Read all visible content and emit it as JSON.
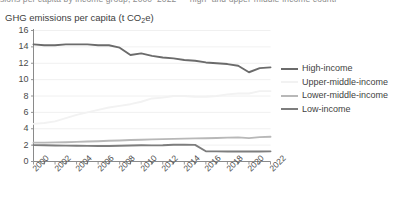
{
  "top_caption_fragment": "sions per capita by income group, 2000–2022 — high- and upper-middle-income countr",
  "chart_data": {
    "type": "line",
    "title": "GHG emissions per capita (t CO",
    "title_sub": "2",
    "title_suffix": "e)",
    "title_full": "GHG emissions per capita (t CO2e)",
    "xlabel": "",
    "ylabel": "",
    "ylim": [
      0,
      16
    ],
    "ytick_step": 2,
    "yticks": [
      "16",
      "14",
      "12",
      "10",
      "8",
      "6",
      "4",
      "2",
      "0"
    ],
    "ytick_values": [
      16,
      14,
      12,
      10,
      8,
      6,
      4,
      2,
      0
    ],
    "xlim": [
      2000,
      2022
    ],
    "xticks": [
      "2000",
      "2002",
      "2004",
      "2006",
      "2008",
      "2010",
      "2012",
      "2014",
      "2016",
      "2018",
      "2020",
      "2022"
    ],
    "xtick_values": [
      2000,
      2002,
      2004,
      2006,
      2008,
      2010,
      2012,
      2014,
      2016,
      2018,
      2020,
      2022
    ],
    "x": [
      2000,
      2001,
      2002,
      2003,
      2004,
      2005,
      2006,
      2007,
      2008,
      2009,
      2010,
      2011,
      2012,
      2013,
      2014,
      2015,
      2016,
      2017,
      2018,
      2019,
      2020,
      2021,
      2022
    ],
    "grid": "horizontal",
    "legend_position": "right",
    "series": [
      {
        "name": "High-income",
        "color": "#6b6b6b",
        "values": [
          14.3,
          14.2,
          14.2,
          14.3,
          14.3,
          14.3,
          14.2,
          14.2,
          13.9,
          13.0,
          13.2,
          12.9,
          12.7,
          12.6,
          12.4,
          12.3,
          12.1,
          12.0,
          11.9,
          11.7,
          10.9,
          11.4,
          11.5
        ]
      },
      {
        "name": "Upper-middle-income",
        "color": "#f2f2f2",
        "values": [
          4.6,
          4.7,
          4.9,
          5.3,
          5.7,
          6.0,
          6.3,
          6.6,
          6.8,
          7.0,
          7.3,
          7.7,
          7.8,
          8.0,
          8.0,
          7.9,
          7.9,
          8.0,
          8.2,
          8.3,
          8.3,
          8.6,
          8.6
        ]
      },
      {
        "name": "Lower-middle-income",
        "color": "#b8b8b8",
        "values": [
          2.3,
          2.31,
          2.33,
          2.36,
          2.4,
          2.44,
          2.48,
          2.53,
          2.57,
          2.62,
          2.66,
          2.7,
          2.73,
          2.76,
          2.79,
          2.82,
          2.84,
          2.87,
          2.92,
          2.95,
          2.86,
          2.98,
          3.02
        ]
      },
      {
        "name": "Low-income",
        "color": "#7d7d7d",
        "values": [
          2.0,
          1.98,
          1.96,
          1.94,
          1.92,
          1.91,
          1.9,
          1.9,
          1.92,
          1.96,
          1.98,
          1.97,
          1.99,
          2.05,
          2.06,
          2.03,
          1.25,
          1.24,
          1.23,
          1.23,
          1.22,
          1.22,
          1.24
        ]
      }
    ]
  },
  "colors": {
    "axis": "#8a8a8a",
    "grid": "#ececec",
    "text": "#404040",
    "background": "#ffffff"
  }
}
